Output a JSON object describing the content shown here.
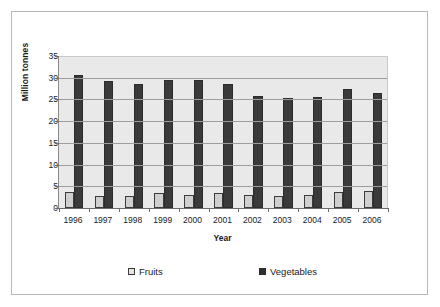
{
  "chart_data": {
    "type": "bar",
    "title": "",
    "subtitle": "",
    "xlabel": "Year",
    "ylabel": "Million tonnes",
    "categories": [
      "1996",
      "1997",
      "1998",
      "1999",
      "2000",
      "2001",
      "2002",
      "2003",
      "2004",
      "2005",
      "2006"
    ],
    "series": [
      {
        "name": "Fruits",
        "color": "#cfcfcf",
        "values": [
          3.7,
          2.8,
          2.8,
          3.4,
          3.0,
          3.4,
          2.9,
          2.7,
          2.9,
          3.6,
          3.9
        ]
      },
      {
        "name": "Vegetables",
        "color": "#3a3a3a",
        "values": [
          30.7,
          29.2,
          28.6,
          29.5,
          29.4,
          28.6,
          25.8,
          25.4,
          25.6,
          27.3,
          26.4
        ]
      }
    ],
    "ylim": [
      0,
      35
    ],
    "ytick_step": 5,
    "yticks": [
      "35",
      "30",
      "25",
      "20",
      "15",
      "10",
      "5",
      "0"
    ],
    "grid": true,
    "grid_axis": "y",
    "legend_position": "bottom",
    "plot_background": "#e9e9e9",
    "grid_color": "#9d9d9d",
    "axis_color": "#6b6b6b",
    "border_color": "#b9b9b9"
  },
  "legend": {
    "entries": [
      {
        "label": "Fruits",
        "swatch": "fruits-swatch"
      },
      {
        "label": "Vegetables",
        "swatch": "vegetables-swatch"
      }
    ]
  }
}
